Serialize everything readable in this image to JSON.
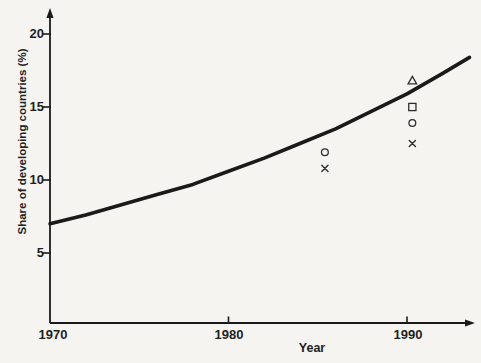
{
  "figure": {
    "background_color": "#f5f4f1",
    "ink_color": "#1a1a1a",
    "marker_color": "#2d2d2d"
  },
  "axes": {
    "x_label": "Year",
    "y_label": "Share of developing countries (%)",
    "x_tick_labels": [
      "1970",
      "1980",
      "1990"
    ],
    "y_tick_labels": [
      "20",
      "15",
      "10",
      "5"
    ]
  },
  "chart_data": {
    "type": "line",
    "title": "",
    "xlabel": "Year",
    "ylabel": "Share of developing countries (%)",
    "x_ticks": [
      1970,
      1980,
      1990
    ],
    "y_ticks": [
      5,
      10,
      15,
      20
    ],
    "xlim": [
      1970,
      1993.8
    ],
    "ylim": [
      0,
      21.5
    ],
    "grid": false,
    "legend": "none",
    "curve": {
      "name": "trend-curve",
      "style": "thick solid",
      "x": [
        1970,
        1972,
        1974,
        1976,
        1978,
        1980,
        1982,
        1984,
        1986,
        1988,
        1990,
        1992,
        1993.5
      ],
      "y": [
        7.0,
        7.6,
        8.3,
        9.0,
        9.7,
        10.6,
        11.5,
        12.5,
        13.5,
        14.7,
        15.9,
        17.3,
        18.4
      ]
    },
    "scatter_series": [
      {
        "name": "triangle-points",
        "marker": "triangle",
        "points": [
          [
            1990.3,
            16.8
          ]
        ]
      },
      {
        "name": "square-points",
        "marker": "square",
        "points": [
          [
            1990.3,
            15.0
          ]
        ]
      },
      {
        "name": "circle-points",
        "marker": "circle",
        "points": [
          [
            1985.4,
            11.9
          ],
          [
            1990.3,
            13.9
          ]
        ]
      },
      {
        "name": "x-points",
        "marker": "x",
        "points": [
          [
            1985.4,
            10.8
          ],
          [
            1990.3,
            12.5
          ]
        ]
      }
    ]
  }
}
